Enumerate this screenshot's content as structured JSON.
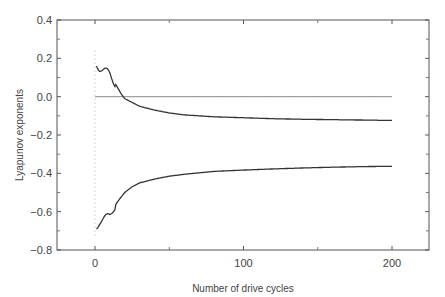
{
  "chart_data": {
    "type": "line",
    "title": "",
    "xlabel": "Number of drive cycles",
    "ylabel": "Lyapunov exponents",
    "xlim": [
      -25,
      225
    ],
    "ylim": [
      -0.8,
      0.4
    ],
    "grid": false,
    "legend": null,
    "xticks": [
      0,
      100,
      200
    ],
    "xtick_labels": [
      "0",
      "100",
      "200"
    ],
    "yticks": [
      0.4,
      0.2,
      0.0,
      -0.2,
      -0.4,
      -0.6,
      -0.8
    ],
    "ytick_labels": [
      "0.4",
      "0.2",
      "0.0",
      "−0.2",
      "−0.4",
      "−0.6",
      "−0.8"
    ],
    "series": [
      {
        "name": "zero exponent",
        "x": [
          0,
          200
        ],
        "y": [
          0.0,
          0.0
        ]
      },
      {
        "name": "upper exponent",
        "x": [
          1,
          3,
          5,
          8,
          10,
          12,
          15,
          18,
          20,
          25,
          30,
          40,
          50,
          60,
          80,
          100,
          120,
          140,
          160,
          180,
          200
        ],
        "y": [
          0.17,
          0.15,
          0.14,
          0.13,
          0.12,
          0.09,
          0.05,
          0.01,
          -0.01,
          -0.03,
          -0.05,
          -0.07,
          -0.085,
          -0.095,
          -0.105,
          -0.11,
          -0.115,
          -0.118,
          -0.12,
          -0.122,
          -0.124
        ]
      },
      {
        "name": "lower exponent",
        "x": [
          1,
          3,
          5,
          8,
          10,
          12,
          15,
          18,
          20,
          25,
          30,
          40,
          50,
          60,
          80,
          100,
          120,
          140,
          160,
          180,
          200
        ],
        "y": [
          -0.68,
          -0.65,
          -0.64,
          -0.63,
          -0.62,
          -0.59,
          -0.55,
          -0.52,
          -0.5,
          -0.47,
          -0.45,
          -0.43,
          -0.415,
          -0.405,
          -0.39,
          -0.383,
          -0.377,
          -0.372,
          -0.368,
          -0.365,
          -0.363
        ]
      },
      {
        "name": "initial scatter",
        "x": [
          0,
          0,
          0,
          0,
          0,
          0,
          0,
          0
        ],
        "y": [
          0.24,
          0.1,
          0.02,
          -0.13,
          -0.22,
          -0.38,
          -0.55,
          -0.72
        ]
      }
    ]
  }
}
